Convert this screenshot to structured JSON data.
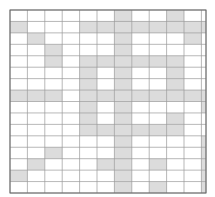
{
  "grid": {
    "columns": 12,
    "rows": 16,
    "fill_color": "#dcdcdc",
    "line_color": "#9a9a9a",
    "background": "#ffffff",
    "filled_cells": [
      [
        0,
        6
      ],
      [
        1,
        6
      ],
      [
        0,
        9
      ],
      [
        1,
        0
      ],
      [
        1,
        4
      ],
      [
        1,
        5
      ],
      [
        1,
        6
      ],
      [
        1,
        7
      ],
      [
        1,
        8
      ],
      [
        1,
        9
      ],
      [
        1,
        10
      ],
      [
        1,
        11
      ],
      [
        2,
        1
      ],
      [
        2,
        6
      ],
      [
        2,
        10
      ],
      [
        3,
        2
      ],
      [
        3,
        6
      ],
      [
        4,
        2
      ],
      [
        4,
        4
      ],
      [
        4,
        5
      ],
      [
        4,
        6
      ],
      [
        4,
        7
      ],
      [
        4,
        8
      ],
      [
        4,
        9
      ],
      [
        5,
        4
      ],
      [
        5,
        6
      ],
      [
        5,
        9
      ],
      [
        6,
        4
      ],
      [
        6,
        6
      ],
      [
        6,
        9
      ],
      [
        7,
        0
      ],
      [
        7,
        1
      ],
      [
        7,
        2
      ],
      [
        7,
        4
      ],
      [
        7,
        5
      ],
      [
        7,
        6
      ],
      [
        7,
        7
      ],
      [
        7,
        8
      ],
      [
        7,
        9
      ],
      [
        7,
        10
      ],
      [
        7,
        11
      ],
      [
        8,
        4
      ],
      [
        8,
        6
      ],
      [
        8,
        11
      ],
      [
        9,
        4
      ],
      [
        9,
        6
      ],
      [
        9,
        9
      ],
      [
        10,
        4
      ],
      [
        10,
        5
      ],
      [
        10,
        6
      ],
      [
        10,
        7
      ],
      [
        10,
        8
      ],
      [
        10,
        9
      ],
      [
        11,
        6
      ],
      [
        11,
        11
      ],
      [
        12,
        2
      ],
      [
        12,
        6
      ],
      [
        12,
        11
      ],
      [
        13,
        1
      ],
      [
        13,
        5
      ],
      [
        13,
        6
      ],
      [
        13,
        8
      ],
      [
        13,
        11
      ],
      [
        14,
        0
      ],
      [
        14,
        6
      ],
      [
        14,
        11
      ],
      [
        15,
        6
      ],
      [
        15,
        8
      ],
      [
        15,
        11
      ]
    ]
  }
}
